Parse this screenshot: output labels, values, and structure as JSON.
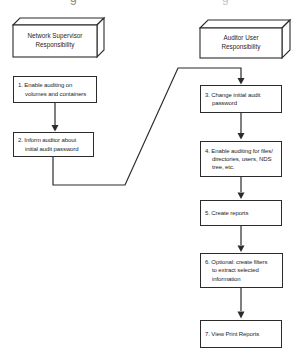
{
  "diagram": {
    "colors": {
      "line": "#2b2b2b",
      "text": "#262626",
      "background": "#ffffff"
    },
    "headers": [
      {
        "lines": [
          "Network Supervisor",
          "Responsibility"
        ]
      },
      {
        "lines": [
          "Auditor User",
          "Responsibility"
        ]
      }
    ],
    "steps": [
      {
        "lines": [
          "1. Enable auditing on",
          "volumes and containers"
        ]
      },
      {
        "lines": [
          "2. Inform auditor about",
          "initial audit password"
        ]
      },
      {
        "lines": [
          "3. Change initial audit",
          "password"
        ]
      },
      {
        "lines": [
          "4. Enable auditing for files/",
          "directories, users, NDS",
          "tree, etc."
        ]
      },
      {
        "lines": [
          "5. Create reports"
        ]
      },
      {
        "lines": [
          "6. Optional: create filters",
          "to extract selected",
          "information"
        ]
      },
      {
        "lines": [
          "7. View Print Reports"
        ]
      }
    ],
    "remnants": [
      {
        "char": "g"
      },
      {
        "char": "g"
      }
    ]
  }
}
